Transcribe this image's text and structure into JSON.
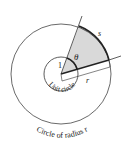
{
  "diagram": {
    "labels": {
      "theta": "θ",
      "arc": "s",
      "unit_radius": "1",
      "radius": "r",
      "unit_circle": "Unit circle",
      "outer_circle": "Circle of radius r"
    },
    "colors": {
      "sector_fill": "#d9d9d9",
      "stroke": "#333333"
    }
  }
}
